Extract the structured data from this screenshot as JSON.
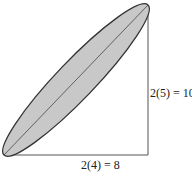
{
  "diagram": {
    "shape": "ellipse",
    "colors": {
      "fill": "#c8c8c8",
      "stroke": "#333333",
      "axis_lines": "#555555"
    },
    "labels": {
      "vertical": "2(5) = 10",
      "horizontal": "2(4) = 8"
    }
  }
}
